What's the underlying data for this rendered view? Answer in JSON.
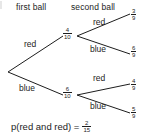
{
  "diagram": {
    "type": "probability-tree",
    "headers": {
      "first": "first ball",
      "second": "second ball"
    },
    "stage1": [
      {
        "label": "red",
        "probability_numerator": "4",
        "probability_denominator": "10"
      },
      {
        "label": "blue",
        "probability_numerator": "6",
        "probability_denominator": "10"
      }
    ],
    "stage2": [
      {
        "parent": "red",
        "label": "red",
        "probability_numerator": "3",
        "probability_denominator": "9"
      },
      {
        "parent": "red",
        "label": "blue",
        "probability_numerator": "6",
        "probability_denominator": "9"
      },
      {
        "parent": "blue",
        "label": "red",
        "probability_numerator": "4",
        "probability_denominator": "9"
      },
      {
        "parent": "blue",
        "label": "blue",
        "probability_numerator": "5",
        "probability_denominator": "9"
      }
    ],
    "conclusion": {
      "text": "p(red and red) =",
      "value_numerator": "2",
      "value_denominator": "15"
    },
    "colors": {
      "ink": "#1d1d1d",
      "background": "#ffffff"
    }
  }
}
